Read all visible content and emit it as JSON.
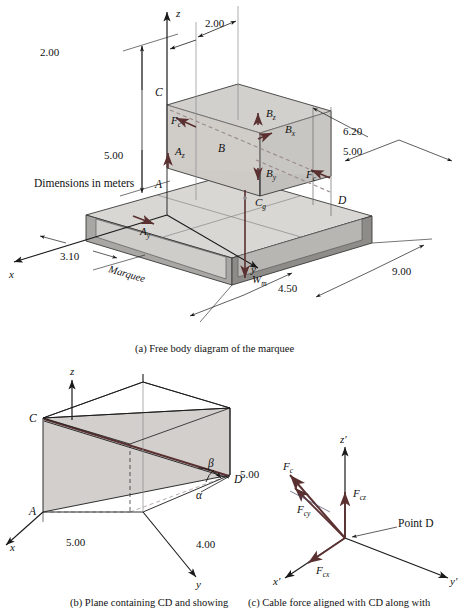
{
  "figure": {
    "title_note": "Dimensions in meters",
    "panels": [
      {
        "id": "a",
        "caption": "(a) Free body diagram of the marquee"
      },
      {
        "id": "b",
        "caption": "(b) Plane containing CD and showing"
      },
      {
        "id": "c",
        "caption": "(c) Cable force aligned with CD along with"
      }
    ]
  },
  "colors": {
    "background": "#ffffff",
    "line": "#1a1a1a",
    "force": "#5a3030",
    "slab_top": "#d9d7d3",
    "slab_side_light": "#c9c7c3",
    "slab_side_dark": "#8e8c88",
    "box_face": "#d2d0cc",
    "box_face_dark": "#c2c0bc",
    "plane_fill": "#d2cfcd",
    "dashed": "#9a8a8a"
  },
  "panel_a": {
    "note": "Dimensions in meters",
    "axes": [
      {
        "name": "z-axis-label",
        "label": "z"
      },
      {
        "name": "y-axis-label",
        "label": "y"
      },
      {
        "name": "x-axis-label",
        "label": "x"
      }
    ],
    "points": [
      {
        "name": "point-C",
        "label": "C"
      },
      {
        "name": "point-B",
        "label": "B"
      },
      {
        "name": "point-A",
        "label": "A"
      },
      {
        "name": "point-D",
        "label": "D"
      }
    ],
    "forces": [
      {
        "name": "force-Fc-upper",
        "base": "F",
        "sub": "c"
      },
      {
        "name": "force-Fc-lower",
        "base": "F",
        "sub": "c"
      },
      {
        "name": "force-Bz",
        "base": "B",
        "sub": "z"
      },
      {
        "name": "force-Bx",
        "base": "B",
        "sub": "x"
      },
      {
        "name": "force-By",
        "base": "B",
        "sub": "y"
      },
      {
        "name": "force-Az",
        "base": "A",
        "sub": "z"
      },
      {
        "name": "force-Ay",
        "base": "A",
        "sub": "y"
      },
      {
        "name": "weight-Wm",
        "base": "W",
        "sub": "m"
      },
      {
        "name": "centroid-Cg",
        "base": "C",
        "sub": "g"
      }
    ],
    "dimensions": [
      {
        "name": "dim-2.00-left",
        "value": "2.00"
      },
      {
        "name": "dim-2.00-right",
        "value": "2.00"
      },
      {
        "name": "dim-5.00-height",
        "value": "5.00"
      },
      {
        "name": "dim-6.20",
        "value": "6.20"
      },
      {
        "name": "dim-5.00-right",
        "value": "5.00"
      },
      {
        "name": "dim-3.10",
        "value": "3.10"
      },
      {
        "name": "dim-4.50",
        "value": "4.50"
      },
      {
        "name": "dim-9.00",
        "value": "9.00"
      }
    ],
    "body_label": "Marquee",
    "caption": "(a) Free body diagram of the marquee"
  },
  "panel_b": {
    "axes": [
      {
        "name": "z-axis-label",
        "label": "z"
      },
      {
        "name": "x-axis-label",
        "label": "x"
      },
      {
        "name": "y-axis-label",
        "label": "y"
      }
    ],
    "points": [
      {
        "name": "point-C",
        "label": "C"
      },
      {
        "name": "point-A",
        "label": "A"
      },
      {
        "name": "point-D",
        "label": "D"
      }
    ],
    "angles": [
      {
        "name": "angle-alpha",
        "label": "α"
      },
      {
        "name": "angle-beta",
        "label": "β"
      }
    ],
    "dimensions": [
      {
        "name": "dim-5.00-height",
        "value": "5.00"
      },
      {
        "name": "dim-5.00-x",
        "value": "5.00"
      },
      {
        "name": "dim-4.00-y",
        "value": "4.00"
      }
    ],
    "caption": "(b) Plane containing CD and showing"
  },
  "panel_c": {
    "axes": [
      {
        "name": "z-prime-axis-label",
        "label": "z′"
      },
      {
        "name": "x-prime-axis-label",
        "label": "x′"
      },
      {
        "name": "y-prime-axis-label",
        "label": "y′"
      }
    ],
    "forces": [
      {
        "name": "force-Fc",
        "base": "F",
        "sub": "c"
      },
      {
        "name": "force-Fcz",
        "base": "F",
        "sub": "cz"
      },
      {
        "name": "force-Fcy",
        "base": "F",
        "sub": "cy"
      },
      {
        "name": "force-Fcx",
        "base": "F",
        "sub": "cx"
      }
    ],
    "point_label": "Point D",
    "caption": "(c) Cable force aligned with CD along with"
  }
}
